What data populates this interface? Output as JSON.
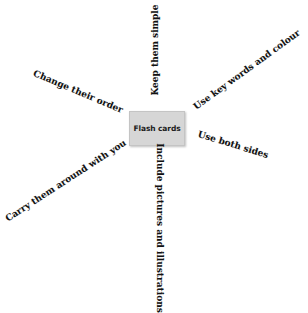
{
  "diagram": {
    "type": "spider-diagram",
    "center": {
      "label": "Flash cards",
      "fill": "#d6d6d6"
    },
    "spokes": [
      {
        "label": "Keep them simple",
        "direction": "up"
      },
      {
        "label": "Use key words and colour",
        "direction": "up-right"
      },
      {
        "label": "Use both sides",
        "direction": "right"
      },
      {
        "label": "Include pictures and illustrations",
        "direction": "down"
      },
      {
        "label": "Carry them around with you",
        "direction": "down-left"
      },
      {
        "label": "Change their order",
        "direction": "up-left"
      }
    ]
  }
}
